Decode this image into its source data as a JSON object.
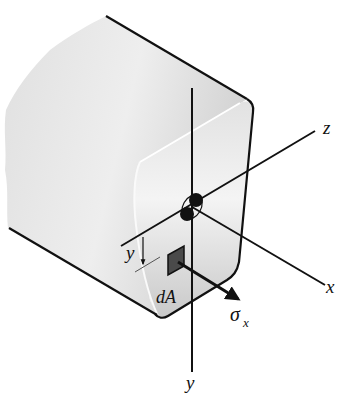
{
  "figure": {
    "labels": {
      "z_axis": "z",
      "x_axis": "x",
      "y_axis": "y",
      "y_distance": "y",
      "element": "dA",
      "stress_symbol": "σ",
      "stress_subscript": "x"
    },
    "colors": {
      "outline": "#111111",
      "beam_light": "#f2f2f2",
      "beam_mid": "#d8d8d8",
      "beam_face": "#e4e4e4",
      "element_fill": "#4a4a4a"
    }
  }
}
